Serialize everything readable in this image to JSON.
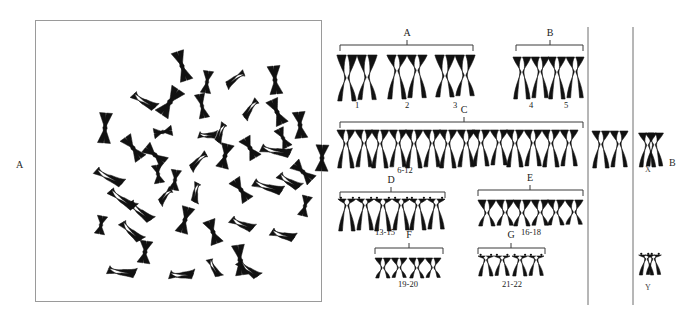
{
  "figure": {
    "background": "#ffffff",
    "ink_color": "#111111",
    "line_color": "#3a3a3a",
    "box_border_color": "#9a9a9a"
  },
  "panels": [
    {
      "id": "A",
      "label": "A",
      "label_x": 18,
      "label_y": 165,
      "type": "metaphase-spread",
      "caption": "Metaphase chromosome spread",
      "box": {
        "x": 35,
        "y": 20,
        "width": 287,
        "height": 282
      },
      "chromosome_count": 46
    },
    {
      "id": "B",
      "label": "B",
      "label_x": 671,
      "label_y": 163,
      "type": "karyotype",
      "caption": "Karyotype arranged by group"
    }
  ],
  "dividers": [
    {
      "name": "divider-left",
      "x": 588,
      "y1": 27,
      "y2": 305
    },
    {
      "name": "divider-right",
      "x": 633,
      "y1": 27,
      "y2": 305
    }
  ],
  "groups": [
    {
      "id": "A",
      "label": "A",
      "label_x": 407,
      "label_y": 36,
      "range": "",
      "range_x": 0,
      "range_y": 0,
      "bracket": {
        "x1": 340,
        "x2": 473,
        "y": 45,
        "tick_x": 407
      },
      "row_y": 55,
      "pairs": [
        {
          "number": "1",
          "num_x": 357,
          "num_y": 108,
          "x": 357,
          "type": "metacentric",
          "height": 46,
          "width": 9
        },
        {
          "number": "2",
          "num_x": 407,
          "num_y": 108,
          "x": 407,
          "type": "submetacentric",
          "height": 44,
          "width": 9
        },
        {
          "number": "3",
          "num_x": 455,
          "num_y": 108,
          "x": 455,
          "type": "metacentric",
          "height": 42,
          "width": 9
        }
      ]
    },
    {
      "id": "B",
      "label": "B",
      "label_x": 550,
      "label_y": 36,
      "range": "",
      "range_x": 0,
      "range_y": 0,
      "bracket": {
        "x1": 516,
        "x2": 583,
        "y": 45,
        "tick_x": 550
      },
      "row_y": 57,
      "pairs": [
        {
          "number": "4",
          "num_x": 531,
          "num_y": 108,
          "x": 531,
          "type": "submetacentric",
          "height": 42,
          "width": 8
        },
        {
          "number": "5",
          "num_x": 566,
          "num_y": 108,
          "x": 566,
          "type": "submetacentric",
          "height": 42,
          "width": 8
        }
      ]
    },
    {
      "id": "C",
      "label": "C",
      "label_x": 464,
      "label_y": 113,
      "range": "6-12",
      "range_x": 405,
      "range_y": 173,
      "bracket": {
        "x1": 340,
        "x2": 583,
        "y": 122,
        "tick_x": 464
      },
      "row_y": 130,
      "pairs": [
        {
          "number": "",
          "num_x": 0,
          "num_y": 0,
          "x": 355,
          "type": "submetacentric",
          "height": 38,
          "width": 8
        },
        {
          "number": "",
          "num_x": 0,
          "num_y": 0,
          "x": 389,
          "type": "submetacentric",
          "height": 38,
          "width": 8
        },
        {
          "number": "",
          "num_x": 0,
          "num_y": 0,
          "x": 423,
          "type": "submetacentric",
          "height": 38,
          "width": 8
        },
        {
          "number": "",
          "num_x": 0,
          "num_y": 0,
          "x": 457,
          "type": "submetacentric",
          "height": 38,
          "width": 8
        },
        {
          "number": "",
          "num_x": 0,
          "num_y": 0,
          "x": 490,
          "type": "submetacentric",
          "height": 36,
          "width": 8
        },
        {
          "number": "",
          "num_x": 0,
          "num_y": 0,
          "x": 524,
          "type": "submetacentric",
          "height": 37,
          "width": 8
        },
        {
          "number": "",
          "num_x": 0,
          "num_y": 0,
          "x": 560,
          "type": "submetacentric",
          "height": 37,
          "width": 8
        }
      ]
    },
    {
      "id": "D",
      "label": "D",
      "label_x": 391,
      "label_y": 183,
      "range": "13-15",
      "range_x": 385,
      "range_y": 235,
      "bracket": {
        "x1": 340,
        "x2": 445,
        "y": 192,
        "tick_x": 391
      },
      "row_y": 199,
      "pairs": [
        {
          "number": "",
          "num_x": 0,
          "num_y": 0,
          "x": 356,
          "type": "acrocentric",
          "height": 32,
          "width": 8
        },
        {
          "number": "",
          "num_x": 0,
          "num_y": 0,
          "x": 392,
          "type": "acrocentric",
          "height": 32,
          "width": 8
        },
        {
          "number": "",
          "num_x": 0,
          "num_y": 0,
          "x": 427,
          "type": "acrocentric",
          "height": 31,
          "width": 8
        }
      ]
    },
    {
      "id": "E",
      "label": "E",
      "label_x": 530,
      "label_y": 181,
      "range": "16-18",
      "range_x": 531,
      "range_y": 235,
      "bracket": {
        "x1": 478,
        "x2": 583,
        "y": 190,
        "tick_x": 530
      },
      "row_y": 200,
      "pairs": [
        {
          "number": "",
          "num_x": 0,
          "num_y": 0,
          "x": 496,
          "type": "metacentric-small",
          "height": 26,
          "width": 8
        },
        {
          "number": "",
          "num_x": 0,
          "num_y": 0,
          "x": 531,
          "type": "metacentric-small",
          "height": 26,
          "width": 8
        },
        {
          "number": "",
          "num_x": 0,
          "num_y": 0,
          "x": 565,
          "type": "metacentric-small",
          "height": 25,
          "width": 8
        }
      ]
    },
    {
      "id": "F",
      "label": "F",
      "label_x": 409,
      "label_y": 238,
      "range": "19-20",
      "range_x": 408,
      "range_y": 287,
      "bracket": {
        "x1": 375,
        "x2": 443,
        "y": 248,
        "tick_x": 409
      },
      "row_y": 258,
      "pairs": [
        {
          "number": "",
          "num_x": 0,
          "num_y": 0,
          "x": 391,
          "type": "metacentric-tiny",
          "height": 20,
          "width": 7
        },
        {
          "number": "",
          "num_x": 0,
          "num_y": 0,
          "x": 425,
          "type": "metacentric-tiny",
          "height": 20,
          "width": 7
        }
      ]
    },
    {
      "id": "G",
      "label": "G",
      "label_x": 511,
      "label_y": 238,
      "range": "21-22",
      "range_x": 512,
      "range_y": 287,
      "bracket": {
        "x1": 478,
        "x2": 545,
        "y": 248,
        "tick_x": 511
      },
      "row_y": 256,
      "pairs": [
        {
          "number": "",
          "num_x": 0,
          "num_y": 0,
          "x": 494,
          "type": "acrocentric-tiny",
          "height": 20,
          "width": 7
        },
        {
          "number": "",
          "num_x": 0,
          "num_y": 0,
          "x": 528,
          "type": "acrocentric-tiny",
          "height": 20,
          "width": 7
        }
      ]
    }
  ],
  "extra_c_pair": {
    "name": "c-group-extra-pair",
    "x": 610,
    "y": 131,
    "height": 37,
    "width": 8
  },
  "sex_chromosomes": [
    {
      "id": "X",
      "label": "X",
      "label_x": 648,
      "label_y": 172,
      "x": 651,
      "y": 133,
      "height": 34,
      "width": 8,
      "type": "submetacentric"
    },
    {
      "id": "Y",
      "label": "Y",
      "label_x": 648,
      "label_y": 290,
      "x": 650,
      "y": 255,
      "height": 20,
      "width": 7,
      "type": "acrocentric-tiny"
    }
  ],
  "spread": {
    "name": "metaphase-spread",
    "description": "Scattered metaphase chromosomes within a bordered square",
    "chromosomes": [
      {
        "cx": 147,
        "cy": 46,
        "r": -18,
        "len": 30,
        "w": 5,
        "shape": "X"
      },
      {
        "cx": 172,
        "cy": 62,
        "r": 8,
        "len": 22,
        "w": 4,
        "shape": "X"
      },
      {
        "cx": 200,
        "cy": 58,
        "r": 70,
        "len": 20,
        "w": 4,
        "shape": "V"
      },
      {
        "cx": 240,
        "cy": 60,
        "r": -6,
        "len": 28,
        "w": 5,
        "shape": "X"
      },
      {
        "cx": 108,
        "cy": 82,
        "r": -42,
        "len": 24,
        "w": 5,
        "shape": "V"
      },
      {
        "cx": 135,
        "cy": 82,
        "r": 34,
        "len": 30,
        "w": 6,
        "shape": "X"
      },
      {
        "cx": 167,
        "cy": 86,
        "r": -12,
        "len": 24,
        "w": 4,
        "shape": "X"
      },
      {
        "cx": 215,
        "cy": 88,
        "r": 52,
        "len": 20,
        "w": 4,
        "shape": "V"
      },
      {
        "cx": 242,
        "cy": 92,
        "r": -24,
        "len": 26,
        "w": 5,
        "shape": "X"
      },
      {
        "cx": 70,
        "cy": 108,
        "r": 4,
        "len": 30,
        "w": 5,
        "shape": "X"
      },
      {
        "cx": 128,
        "cy": 112,
        "r": 80,
        "len": 18,
        "w": 4,
        "shape": "X"
      },
      {
        "cx": 265,
        "cy": 105,
        "r": -6,
        "len": 26,
        "w": 5,
        "shape": "X"
      },
      {
        "cx": 185,
        "cy": 112,
        "r": 38,
        "len": 18,
        "w": 4,
        "shape": "V"
      },
      {
        "cx": 98,
        "cy": 128,
        "r": -36,
        "len": 26,
        "w": 5,
        "shape": "X"
      },
      {
        "cx": 120,
        "cy": 135,
        "r": -50,
        "len": 24,
        "w": 5,
        "shape": "X"
      },
      {
        "cx": 163,
        "cy": 140,
        "r": 62,
        "len": 20,
        "w": 4,
        "shape": "V"
      },
      {
        "cx": 190,
        "cy": 136,
        "r": 14,
        "len": 24,
        "w": 5,
        "shape": "X"
      },
      {
        "cx": 215,
        "cy": 128,
        "r": -30,
        "len": 22,
        "w": 5,
        "shape": "X"
      },
      {
        "cx": 240,
        "cy": 132,
        "r": -64,
        "len": 28,
        "w": 5,
        "shape": "V"
      },
      {
        "cx": 287,
        "cy": 138,
        "r": 2,
        "len": 26,
        "w": 5,
        "shape": "X"
      },
      {
        "cx": 73,
        "cy": 158,
        "r": -48,
        "len": 28,
        "w": 5,
        "shape": "V"
      },
      {
        "cx": 140,
        "cy": 160,
        "r": 8,
        "len": 20,
        "w": 4,
        "shape": "X"
      },
      {
        "cx": 160,
        "cy": 172,
        "r": 28,
        "len": 18,
        "w": 4,
        "shape": "V"
      },
      {
        "cx": 206,
        "cy": 170,
        "r": -34,
        "len": 24,
        "w": 5,
        "shape": "X"
      },
      {
        "cx": 232,
        "cy": 168,
        "r": -58,
        "len": 28,
        "w": 5,
        "shape": "V"
      },
      {
        "cx": 253,
        "cy": 162,
        "r": -40,
        "len": 22,
        "w": 5,
        "shape": "V"
      },
      {
        "cx": 268,
        "cy": 152,
        "r": -46,
        "len": 24,
        "w": 5,
        "shape": "X"
      },
      {
        "cx": 86,
        "cy": 180,
        "r": -40,
        "len": 28,
        "w": 5,
        "shape": "V"
      },
      {
        "cx": 104,
        "cy": 192,
        "r": -34,
        "len": 26,
        "w": 5,
        "shape": "V"
      },
      {
        "cx": 66,
        "cy": 205,
        "r": 10,
        "len": 18,
        "w": 4,
        "shape": "X"
      },
      {
        "cx": 95,
        "cy": 212,
        "r": -30,
        "len": 24,
        "w": 5,
        "shape": "V"
      },
      {
        "cx": 150,
        "cy": 200,
        "r": 16,
        "len": 26,
        "w": 5,
        "shape": "X"
      },
      {
        "cx": 178,
        "cy": 212,
        "r": -20,
        "len": 24,
        "w": 5,
        "shape": "X"
      },
      {
        "cx": 206,
        "cy": 205,
        "r": -48,
        "len": 22,
        "w": 5,
        "shape": "V"
      },
      {
        "cx": 110,
        "cy": 232,
        "r": 8,
        "len": 22,
        "w": 5,
        "shape": "X"
      },
      {
        "cx": 205,
        "cy": 240,
        "r": -8,
        "len": 30,
        "w": 5,
        "shape": "X"
      },
      {
        "cx": 130,
        "cy": 175,
        "r": 60,
        "len": 16,
        "w": 4,
        "shape": "V"
      },
      {
        "cx": 247,
        "cy": 216,
        "r": -56,
        "len": 22,
        "w": 5,
        "shape": "V"
      },
      {
        "cx": 123,
        "cy": 154,
        "r": -10,
        "len": 18,
        "w": 4,
        "shape": "X"
      },
      {
        "cx": 172,
        "cy": 116,
        "r": -70,
        "len": 16,
        "w": 4,
        "shape": "V"
      },
      {
        "cx": 212,
        "cy": 250,
        "r": -34,
        "len": 22,
        "w": 5,
        "shape": "V"
      },
      {
        "cx": 86,
        "cy": 253,
        "r": -66,
        "len": 26,
        "w": 5,
        "shape": "V"
      },
      {
        "cx": 146,
        "cy": 256,
        "r": -72,
        "len": 22,
        "w": 5,
        "shape": "V"
      },
      {
        "cx": 248,
        "cy": 118,
        "r": -26,
        "len": 20,
        "w": 4,
        "shape": "X"
      },
      {
        "cx": 178,
        "cy": 248,
        "r": -12,
        "len": 18,
        "w": 4,
        "shape": "V"
      },
      {
        "cx": 270,
        "cy": 186,
        "r": 14,
        "len": 20,
        "w": 4,
        "shape": "X"
      }
    ]
  }
}
